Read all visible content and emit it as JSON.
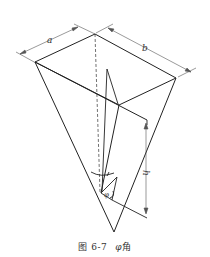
{
  "figure": {
    "labels": {
      "a": "a",
      "b": "b",
      "h": "h",
      "phi": "φ"
    },
    "caption": {
      "number": "图 6-7",
      "title_symbol": "φ",
      "title_text": "角"
    },
    "colors": {
      "line": "#222222",
      "dim_line": "#555555",
      "background": "#ffffff"
    }
  }
}
